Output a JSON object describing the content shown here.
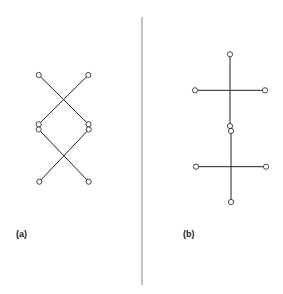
{
  "panels": [
    {
      "label": "(a)",
      "edges": [
        [
          38.7,
          75,
          88.5,
          124.3
        ],
        [
          88.3,
          75,
          38.7,
          124.3
        ],
        [
          38.7,
          129.5,
          88.7,
          181.7
        ],
        [
          88.7,
          129.5,
          39.3,
          181.7
        ]
      ],
      "nodes": [
        [
          38.7,
          75
        ],
        [
          88.3,
          75
        ],
        [
          38.7,
          124.3
        ],
        [
          88.5,
          124.3
        ],
        [
          38.7,
          129.5
        ],
        [
          88.7,
          129.5
        ],
        [
          39.3,
          181.7
        ],
        [
          88.7,
          181.7
        ]
      ]
    },
    {
      "label": "(b)",
      "edges": [
        [
          230,
          54.3,
          230,
          126
        ],
        [
          195,
          90.3,
          265,
          90.3
        ],
        [
          231,
          131,
          231,
          202
        ],
        [
          196,
          166.7,
          266,
          166.7
        ]
      ],
      "nodes": [
        [
          230,
          54.3
        ],
        [
          195,
          90.3
        ],
        [
          265,
          90.3
        ],
        [
          230,
          126
        ],
        [
          231,
          131
        ],
        [
          196,
          166.7
        ],
        [
          266,
          166.7
        ],
        [
          231,
          202
        ]
      ]
    }
  ],
  "divider": {
    "x": 142,
    "y1": 17,
    "y2": 285,
    "color": "#999999"
  },
  "colors": {
    "edge": "#222222",
    "node_stroke": "#333333"
  }
}
